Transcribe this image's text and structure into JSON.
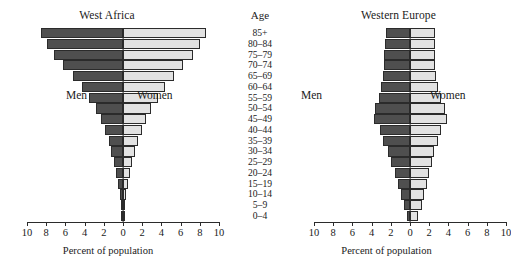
{
  "figure": {
    "xaxis_title": "Percent of population",
    "age_axis_title": "Age",
    "men_label": "Men",
    "women_label": "Women",
    "men_color": "#4f4f4f",
    "women_color": "#e2e2e2",
    "axis_color": "#2b2b2b"
  },
  "chart_data": {
    "type": "bar",
    "subtype": "population-pyramid",
    "title": "",
    "xlabel": "Percent of population",
    "ylabel": "Age",
    "xlim": [
      -10,
      10
    ],
    "xticks": [
      10,
      8,
      6,
      4,
      2,
      0,
      2,
      4,
      6,
      8,
      10
    ],
    "grid": false,
    "legend": [
      "Men",
      "Women"
    ],
    "legend_position": "inside-annotations",
    "categories": [
      "85+",
      "80–84",
      "75–79",
      "70–74",
      "65–69",
      "60–64",
      "55–59",
      "50–54",
      "45–49",
      "40–44",
      "35–39",
      "30–34",
      "25–29",
      "20–24",
      "15–19",
      "10–14",
      "5–9",
      "0–4"
    ],
    "panels": [
      {
        "name": "West Africa",
        "series": [
          {
            "name": "Men",
            "values": [
              0.1,
              0.2,
              0.3,
              0.5,
              0.7,
              0.9,
              1.2,
              1.5,
              1.9,
              2.3,
              2.8,
              3.5,
              4.3,
              5.2,
              6.2,
              7.2,
              7.9,
              8.5
            ]
          },
          {
            "name": "Women",
            "values": [
              0.1,
              0.2,
              0.3,
              0.5,
              0.7,
              0.9,
              1.2,
              1.6,
              2.0,
              2.4,
              2.9,
              3.6,
              4.4,
              5.3,
              6.3,
              7.3,
              8.0,
              8.6
            ]
          }
        ]
      },
      {
        "name": "Western Europe",
        "series": [
          {
            "name": "Men",
            "values": [
              0.3,
              0.6,
              0.9,
              1.3,
              1.6,
              2.0,
              2.3,
              2.8,
              3.1,
              3.8,
              3.6,
              3.2,
              3.0,
              2.8,
              2.7,
              2.7,
              2.6,
              2.5
            ]
          },
          {
            "name": "Women",
            "values": [
              0.8,
              1.2,
              1.5,
              1.8,
              2.0,
              2.3,
              2.5,
              2.9,
              3.2,
              3.9,
              3.6,
              3.2,
              2.9,
              2.7,
              2.6,
              2.6,
              2.6,
              2.6
            ]
          }
        ]
      }
    ]
  }
}
